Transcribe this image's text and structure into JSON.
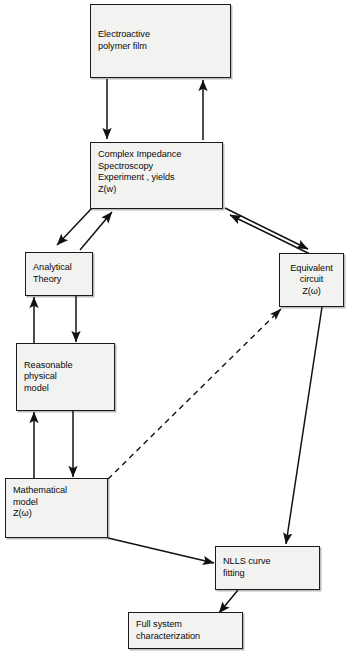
{
  "diagram": {
    "nodes": {
      "electroactive_film": {
        "id": "electroactive-polymer-film",
        "lines": [
          "Electroactive",
          "polymer film"
        ]
      },
      "complex_impedance": {
        "id": "complex-impedance-spectroscopy",
        "lines": [
          "Complex Impedance",
          "Spectroscopy",
          "Experiment , yields",
          "Z(w)"
        ]
      },
      "analytical_theory": {
        "id": "analytical-theory",
        "lines": [
          "Analytical",
          "Theory"
        ]
      },
      "equivalent_circuit": {
        "id": "equivalent-circuit",
        "lines": [
          "Equivalent",
          "circuit",
          "Z(ω)"
        ]
      },
      "reasonable_model": {
        "id": "reasonable-physical-model",
        "lines": [
          "Reasonable",
          "physical",
          "model"
        ]
      },
      "mathematical_model": {
        "id": "mathematical-model",
        "lines": [
          "Mathematical",
          "model",
          "Z(ω)"
        ]
      },
      "nlls_fitting": {
        "id": "nlls-curve-fitting",
        "lines": [
          "NLLS curve",
          "fitting"
        ]
      },
      "full_system": {
        "id": "full-system-characterization",
        "lines": [
          "Full system",
          "characterization"
        ]
      }
    },
    "edges": [
      {
        "name": "film-to-experiment",
        "from": "electroactive_film",
        "to": "complex_impedance",
        "style": "solid",
        "arrows": "end"
      },
      {
        "name": "experiment-to-film",
        "from": "complex_impedance",
        "to": "electroactive_film",
        "style": "solid",
        "arrows": "end"
      },
      {
        "name": "experiment-to-analytical-theory",
        "from": "complex_impedance",
        "to": "analytical_theory",
        "style": "solid",
        "arrows": "end"
      },
      {
        "name": "analytical-theory-to-experiment",
        "from": "analytical_theory",
        "to": "complex_impedance",
        "style": "solid",
        "arrows": "end"
      },
      {
        "name": "experiment-to-equivalent-circuit",
        "from": "complex_impedance",
        "to": "equivalent_circuit",
        "style": "solid",
        "arrows": "end"
      },
      {
        "name": "equivalent-circuit-to-experiment",
        "from": "equivalent_circuit",
        "to": "complex_impedance",
        "style": "solid",
        "arrows": "end"
      },
      {
        "name": "analytical-theory-to-reasonable-model",
        "from": "analytical_theory",
        "to": "reasonable_model",
        "style": "solid",
        "arrows": "end"
      },
      {
        "name": "reasonable-model-to-analytical-theory",
        "from": "reasonable_model",
        "to": "analytical_theory",
        "style": "solid",
        "arrows": "end"
      },
      {
        "name": "reasonable-model-to-mathematical-model",
        "from": "reasonable_model",
        "to": "mathematical_model",
        "style": "solid",
        "arrows": "end"
      },
      {
        "name": "mathematical-model-to-reasonable-model",
        "from": "mathematical_model",
        "to": "reasonable_model",
        "style": "solid",
        "arrows": "end"
      },
      {
        "name": "mathematical-model-to-equivalent-circuit",
        "from": "mathematical_model",
        "to": "equivalent_circuit",
        "style": "dashed",
        "arrows": "end"
      },
      {
        "name": "mathematical-model-to-nlls",
        "from": "mathematical_model",
        "to": "nlls_fitting",
        "style": "solid",
        "arrows": "end"
      },
      {
        "name": "equivalent-circuit-to-nlls",
        "from": "equivalent_circuit",
        "to": "nlls_fitting",
        "style": "solid",
        "arrows": "end"
      },
      {
        "name": "nlls-to-full-system",
        "from": "nlls_fitting",
        "to": "full_system",
        "style": "solid",
        "arrows": "end"
      }
    ],
    "colors": {
      "node_fill": "#f2f2f0",
      "node_border": "#1a1a1a",
      "edge": "#111111",
      "background": "#ffffff"
    },
    "caption": ""
  }
}
